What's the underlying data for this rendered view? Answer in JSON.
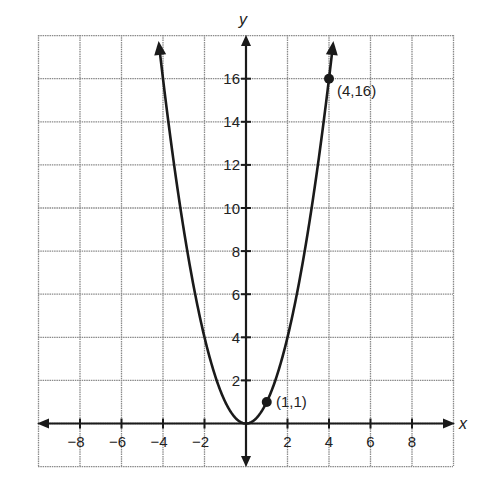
{
  "chart_data": {
    "type": "line",
    "title": "",
    "function": "y = x^2",
    "xlabel": "x",
    "ylabel": "y",
    "xlim": [
      -10,
      10
    ],
    "ylim": [
      -2,
      18
    ],
    "grid": true,
    "grid_step": 2,
    "x_ticks": [
      -8,
      -6,
      -4,
      -2,
      2,
      4,
      6,
      8
    ],
    "y_ticks": [
      2,
      4,
      6,
      8,
      10,
      12,
      14,
      16
    ],
    "x": [
      -4.25,
      -4,
      -3,
      -2,
      -1,
      0,
      1,
      2,
      3,
      4,
      4.25
    ],
    "values": [
      18.06,
      16,
      9,
      4,
      1,
      0,
      1,
      4,
      9,
      16,
      18.06
    ],
    "points": [
      {
        "x": 1,
        "y": 1,
        "label": "(1,1)"
      },
      {
        "x": 4,
        "y": 16,
        "label": "(4,16)"
      }
    ],
    "curve_end_arrows": true,
    "axis_arrows": true
  },
  "labels": {
    "x_axis": "x",
    "y_axis": "y",
    "x_ticks": [
      "−8",
      "−6",
      "−4",
      "−2",
      "2",
      "4",
      "6",
      "8"
    ],
    "y_ticks": [
      "2",
      "4",
      "6",
      "8",
      "10",
      "12",
      "14",
      "16"
    ],
    "point_1": "(1,1)",
    "point_2": "(4,16)"
  },
  "colors": {
    "grid": "#8a8a8a",
    "axis": "#1a1a1a",
    "curve": "#1a1a1a",
    "background": "#ffffff"
  }
}
